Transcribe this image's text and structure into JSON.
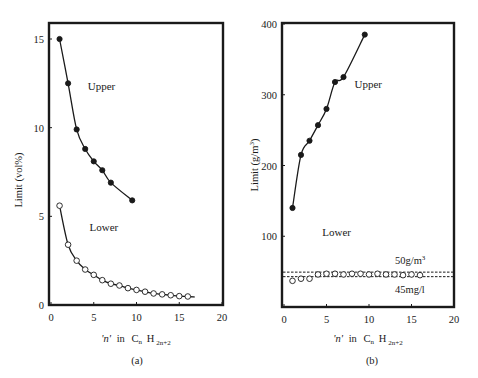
{
  "chart_data": [
    {
      "type": "scatter",
      "panel": "(a)",
      "caption": "(a)",
      "title": "",
      "xlabel": "'n' in CnH2n+2",
      "xlabel_parts": {
        "quote_n": "'n'",
        "in": "in",
        "C": "C",
        "C_sub": "n",
        "H": "H",
        "H_sub": "2n+2"
      },
      "ylabel": "Limit (vol%)",
      "xlim": [
        0,
        20
      ],
      "ylim": [
        0,
        16
      ],
      "xticks": [
        0,
        5,
        10,
        15,
        20
      ],
      "yticks": [
        0,
        5,
        10,
        15
      ],
      "grid": false,
      "series": [
        {
          "name": "Upper",
          "marker": "filled-circle",
          "line": "smooth",
          "x": [
            1,
            2,
            3,
            4,
            5,
            6,
            7,
            9.5
          ],
          "y": [
            15.0,
            12.5,
            9.9,
            8.8,
            8.1,
            7.6,
            6.9,
            5.9
          ]
        },
        {
          "name": "Lower",
          "marker": "open-circle",
          "line": "smooth",
          "x": [
            1,
            2,
            3,
            4,
            5,
            6,
            7,
            8,
            9,
            10,
            11,
            12,
            13,
            14,
            15,
            16
          ],
          "y": [
            5.6,
            3.4,
            2.5,
            2.0,
            1.7,
            1.4,
            1.2,
            1.1,
            0.95,
            0.85,
            0.75,
            0.65,
            0.6,
            0.55,
            0.5,
            0.48
          ]
        }
      ],
      "annotations": [
        {
          "text": "Upper",
          "x": 4.3,
          "y": 12.1
        },
        {
          "text": "Lower",
          "x": 4.5,
          "y": 4.2
        }
      ]
    },
    {
      "type": "scatter",
      "panel": "(b)",
      "caption": "(b)",
      "title": "",
      "xlabel": "'n' in CnH2n+2",
      "xlabel_parts": {
        "quote_n": "'n'",
        "in": "in",
        "C": "C",
        "C_sub": "n",
        "H": "H",
        "H_sub": "2n+2"
      },
      "ylabel": "Limit (g/m3)",
      "ylabel_parts": {
        "main": "Limit (g/m",
        "sup": "3",
        "close": ")"
      },
      "xlim": [
        0,
        20
      ],
      "ylim": [
        0,
        400
      ],
      "xticks": [
        0,
        5,
        10,
        15,
        20
      ],
      "yticks": [
        100,
        200,
        300,
        400
      ],
      "grid": false,
      "series": [
        {
          "name": "Upper",
          "marker": "filled-circle",
          "line": "smooth",
          "x": [
            1,
            2,
            3,
            4,
            5,
            6,
            7,
            9.5
          ],
          "y": [
            140,
            215,
            235,
            257,
            280,
            318,
            325,
            385
          ]
        },
        {
          "name": "Lower",
          "marker": "open-circle",
          "line": "none",
          "x": [
            1,
            2,
            3,
            4,
            5,
            6,
            7,
            8,
            9,
            10,
            11,
            12,
            13,
            14,
            15,
            16
          ],
          "y": [
            37,
            40,
            40,
            46,
            47,
            47,
            46,
            47,
            47,
            46,
            47,
            46,
            46,
            45,
            46,
            45
          ]
        }
      ],
      "reference_lines": [
        {
          "label": "50g/m3",
          "label_parts": {
            "main": "50g/m",
            "sup": "3"
          },
          "y": 50,
          "style": "dashed"
        },
        {
          "label": "45mg/l",
          "y": 45,
          "style": "dashed"
        }
      ],
      "annotations": [
        {
          "text": "Upper",
          "x": 8.3,
          "y": 310
        },
        {
          "text": "Lower",
          "x": 4.5,
          "y": 101
        }
      ]
    }
  ]
}
